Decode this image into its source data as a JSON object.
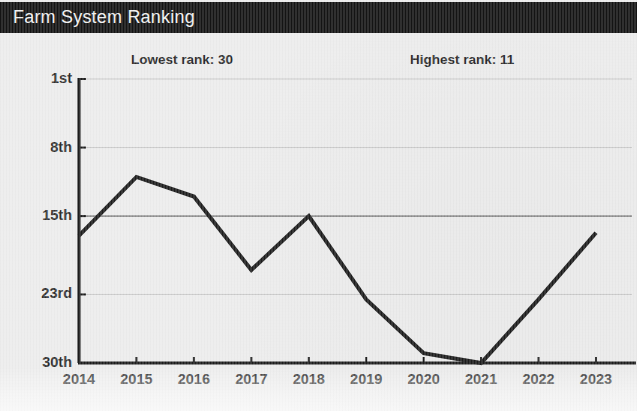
{
  "header": {
    "title": "Farm System Ranking",
    "bar_color": "#141414",
    "text_color": "#f2f2f2"
  },
  "annotations": [
    {
      "name": "lowest-rank",
      "text": "Lowest rank: 30"
    },
    {
      "name": "highest-rank",
      "text": "Highest rank: 11"
    }
  ],
  "chart_data": {
    "type": "line",
    "title": "Farm System Ranking",
    "xlabel": "",
    "ylabel": "",
    "categories": [
      "2014",
      "2015",
      "2016",
      "2017",
      "2018",
      "2019",
      "2020",
      "2021",
      "2022",
      "2023"
    ],
    "values": [
      17,
      11,
      13,
      20.5,
      15,
      23.5,
      29,
      30,
      23.5,
      16.7
    ],
    "ytick_labels": [
      "1st",
      "8th",
      "15th",
      "23rd",
      "30th"
    ],
    "ytick_values": [
      1,
      8,
      15,
      23,
      30
    ],
    "ylim": [
      1,
      30
    ],
    "y_inverted": true,
    "grid": true,
    "legend": false,
    "line_color": "#1c1c1c",
    "grid_color": "#c9c9c9",
    "axis_color": "#1c1c1c",
    "background_color": "#eeeeee",
    "annotations": [
      {
        "label": "Lowest rank: 30"
      },
      {
        "label": "Highest rank: 11"
      }
    ]
  }
}
